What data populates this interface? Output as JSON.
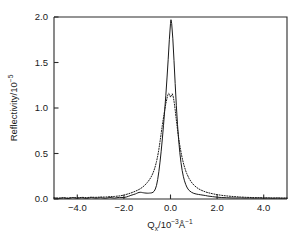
{
  "figure": {
    "background_color": "#ffffff",
    "foreground_color": "#1a1a1a",
    "plot_area": {
      "left": 54,
      "top": 17,
      "right": 287,
      "bottom": 199
    }
  },
  "axes": {
    "x": {
      "title_main": "Q",
      "title_sub": "x",
      "title_mid": "/10",
      "title_sup": "−3",
      "title_unit": "Å",
      "title_unit_sup": "−1",
      "full_label": "Qx/10−3Å−1",
      "ticks": [
        "-4.0",
        "-2.0",
        "0.0",
        "2.0",
        "4.0"
      ],
      "tick_values": [
        -4.0,
        -2.0,
        0.0,
        2.0,
        4.0
      ],
      "range": [
        -5.0,
        5.0
      ]
    },
    "y": {
      "title_main": "Reflectivity/10",
      "title_sup": "−5",
      "full_label": "Reflectivity/10−5",
      "ticks": [
        "0.0",
        "0.5",
        "1.0",
        "1.5",
        "2.0"
      ],
      "tick_values": [
        0.0,
        0.5,
        1.0,
        1.5,
        2.0
      ],
      "range": [
        0.0,
        2.0
      ]
    }
  },
  "chart_data": {
    "type": "line",
    "title": "",
    "xlabel": "Qx/10−3Å−1",
    "ylabel": "Reflectivity/10−5",
    "xlim": [
      -5.0,
      5.0
    ],
    "ylim": [
      0.0,
      2.0
    ],
    "grid": false,
    "legend": null,
    "series": [
      {
        "name": "measured-reflectivity",
        "style": "solid",
        "color": "#1a1a1a",
        "peak_x": 0.02,
        "peak_y": 1.97,
        "x": [
          -5.0,
          -4.8,
          -4.6,
          -4.4,
          -4.2,
          -4.0,
          -3.8,
          -3.6,
          -3.4,
          -3.2,
          -3.0,
          -2.8,
          -2.6,
          -2.4,
          -2.2,
          -2.0,
          -1.9,
          -1.8,
          -1.7,
          -1.6,
          -1.5,
          -1.45,
          -1.4,
          -1.35,
          -1.3,
          -1.25,
          -1.2,
          -1.15,
          -1.1,
          -1.05,
          -1.0,
          -0.95,
          -0.9,
          -0.85,
          -0.8,
          -0.75,
          -0.7,
          -0.65,
          -0.6,
          -0.55,
          -0.5,
          -0.45,
          -0.4,
          -0.35,
          -0.3,
          -0.25,
          -0.2,
          -0.15,
          -0.1,
          -0.05,
          0.0,
          0.02,
          0.05,
          0.1,
          0.15,
          0.2,
          0.25,
          0.3,
          0.35,
          0.4,
          0.45,
          0.5,
          0.55,
          0.6,
          0.65,
          0.7,
          0.75,
          0.8,
          0.9,
          1.0,
          1.1,
          1.2,
          1.3,
          1.4,
          1.5,
          1.6,
          1.8,
          2.0,
          2.2,
          2.4,
          2.6,
          2.8,
          3.0,
          3.2,
          3.4,
          3.6,
          3.8,
          4.0,
          4.2,
          4.4,
          4.6,
          4.8,
          5.0
        ],
        "y": [
          0.01,
          0.006,
          0.012,
          0.005,
          0.014,
          0.008,
          0.013,
          0.006,
          0.015,
          0.009,
          0.014,
          0.008,
          0.016,
          0.01,
          0.018,
          0.016,
          0.022,
          0.03,
          0.04,
          0.048,
          0.056,
          0.062,
          0.068,
          0.072,
          0.074,
          0.073,
          0.07,
          0.068,
          0.066,
          0.065,
          0.064,
          0.064,
          0.065,
          0.066,
          0.068,
          0.074,
          0.086,
          0.11,
          0.15,
          0.215,
          0.3,
          0.405,
          0.525,
          0.66,
          0.81,
          0.97,
          1.14,
          1.33,
          1.53,
          1.75,
          1.93,
          1.97,
          1.93,
          1.76,
          1.52,
          1.27,
          1.03,
          0.82,
          0.65,
          0.51,
          0.4,
          0.315,
          0.25,
          0.2,
          0.162,
          0.132,
          0.11,
          0.094,
          0.074,
          0.062,
          0.055,
          0.05,
          0.046,
          0.042,
          0.038,
          0.033,
          0.026,
          0.02,
          0.016,
          0.014,
          0.012,
          0.011,
          0.012,
          0.01,
          0.011,
          0.009,
          0.011,
          0.009,
          0.01,
          0.008,
          0.01,
          0.008,
          0.009
        ]
      },
      {
        "name": "calculated-reflectivity",
        "style": "dotted",
        "color": "#1a1a1a",
        "peak_x": -0.12,
        "peak_y": 1.17,
        "x": [
          -5.0,
          -4.8,
          -4.6,
          -4.4,
          -4.2,
          -4.0,
          -3.8,
          -3.6,
          -3.4,
          -3.2,
          -3.0,
          -2.8,
          -2.6,
          -2.4,
          -2.2,
          -2.0,
          -1.9,
          -1.8,
          -1.7,
          -1.6,
          -1.5,
          -1.4,
          -1.3,
          -1.2,
          -1.1,
          -1.0,
          -0.95,
          -0.9,
          -0.85,
          -0.8,
          -0.75,
          -0.7,
          -0.65,
          -0.6,
          -0.55,
          -0.5,
          -0.45,
          -0.4,
          -0.35,
          -0.3,
          -0.25,
          -0.2,
          -0.16,
          -0.12,
          -0.08,
          -0.04,
          0.0,
          0.04,
          0.08,
          0.12,
          0.16,
          0.2,
          0.25,
          0.3,
          0.35,
          0.4,
          0.45,
          0.5,
          0.55,
          0.6,
          0.65,
          0.7,
          0.8,
          0.9,
          1.0,
          1.1,
          1.2,
          1.3,
          1.4,
          1.5,
          1.6,
          1.8,
          2.0,
          2.2,
          2.4,
          2.6,
          2.8,
          3.0,
          3.2,
          3.4,
          3.6,
          3.8,
          4.0,
          4.2,
          4.4,
          4.6,
          4.8,
          5.0
        ],
        "y": [
          0.012,
          0.01,
          0.014,
          0.011,
          0.016,
          0.013,
          0.018,
          0.015,
          0.02,
          0.018,
          0.022,
          0.021,
          0.026,
          0.028,
          0.034,
          0.042,
          0.05,
          0.058,
          0.066,
          0.076,
          0.086,
          0.098,
          0.112,
          0.13,
          0.152,
          0.18,
          0.196,
          0.214,
          0.234,
          0.258,
          0.286,
          0.32,
          0.362,
          0.412,
          0.472,
          0.545,
          0.63,
          0.72,
          0.81,
          0.895,
          0.975,
          1.05,
          1.095,
          1.14,
          1.16,
          1.15,
          1.12,
          1.135,
          1.155,
          1.12,
          1.06,
          0.98,
          0.87,
          0.765,
          0.67,
          0.588,
          0.516,
          0.452,
          0.398,
          0.352,
          0.312,
          0.278,
          0.224,
          0.184,
          0.154,
          0.131,
          0.113,
          0.099,
          0.088,
          0.078,
          0.07,
          0.058,
          0.048,
          0.04,
          0.034,
          0.029,
          0.025,
          0.022,
          0.019,
          0.017,
          0.015,
          0.014,
          0.013,
          0.012,
          0.011,
          0.011,
          0.01,
          0.01
        ]
      }
    ]
  }
}
